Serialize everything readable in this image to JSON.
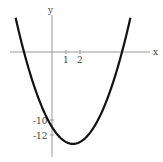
{
  "chart_data": {
    "type": "line",
    "title": "",
    "function": "y = x^2 - 3x - 10",
    "xlabel": "x",
    "ylabel": "y",
    "x_ticks": [
      {
        "value": 1,
        "label": "1"
      },
      {
        "value": 2,
        "label": "2"
      }
    ],
    "y_ticks": [
      {
        "value": -10,
        "label": "-10"
      },
      {
        "value": -12,
        "label": "-12"
      }
    ],
    "xlim": [
      -3,
      7
    ],
    "ylim": [
      -15,
      5
    ],
    "grid": false,
    "series": [
      {
        "name": "parabola",
        "x": [
          -3,
          -2,
          -1,
          0,
          1,
          1.5,
          2,
          3,
          4,
          5,
          6
        ],
        "y": [
          8,
          0,
          -6,
          -10,
          -12,
          -12.25,
          -12,
          -10,
          -6,
          0,
          8
        ]
      }
    ],
    "annotations": {
      "roots": [
        -2,
        5
      ],
      "y_intercept": -10,
      "vertex": [
        1.5,
        -12.25
      ]
    }
  },
  "labels": {
    "x_axis": "x",
    "y_axis": "y",
    "tick_x1": "1",
    "tick_x2": "2",
    "tick_y10": "-10",
    "tick_y12": "-12"
  }
}
